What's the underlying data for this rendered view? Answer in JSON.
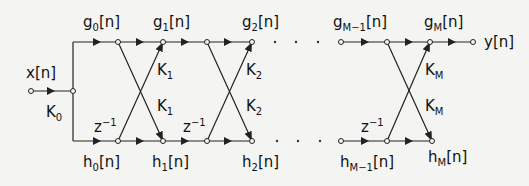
{
  "colors": {
    "line": "#222222",
    "background": "#f4f4f2"
  },
  "labels": {
    "input": {
      "base": "x",
      "arg": "[n]"
    },
    "k0": {
      "base": "K",
      "sub": "0"
    },
    "g0": {
      "base": "g",
      "sub": "0",
      "arg": "[n]"
    },
    "g1": {
      "base": "g",
      "sub": "1",
      "arg": "[n]"
    },
    "g2": {
      "base": "g",
      "sub": "2",
      "arg": "[n]"
    },
    "gM1": {
      "base": "g",
      "sub": "M−1",
      "arg": "[n]"
    },
    "gM": {
      "base": "g",
      "sub": "M",
      "arg": "[n]"
    },
    "output": {
      "base": "y",
      "arg": "[n]"
    },
    "h0": {
      "base": "h",
      "sub": "0",
      "arg": "[n]"
    },
    "h1": {
      "base": "h",
      "sub": "1",
      "arg": "[n]"
    },
    "h2": {
      "base": "h",
      "sub": "2",
      "arg": "[n]"
    },
    "hM1": {
      "base": "h",
      "sub": "M−1",
      "arg": "[n]"
    },
    "hM": {
      "base": "h",
      "sub": "M",
      "arg": "[n]"
    },
    "k1a": {
      "base": "K",
      "sub": "1"
    },
    "k1b": {
      "base": "K",
      "sub": "1"
    },
    "k2a": {
      "base": "K",
      "sub": "2"
    },
    "k2b": {
      "base": "K",
      "sub": "2"
    },
    "kMa": {
      "base": "K",
      "sub": "M"
    },
    "kMb": {
      "base": "K",
      "sub": "M"
    },
    "z1": {
      "base": "z",
      "sup": "−1"
    },
    "z2": {
      "base": "z",
      "sup": "−1"
    },
    "zM": {
      "base": "z",
      "sup": "−1"
    }
  }
}
